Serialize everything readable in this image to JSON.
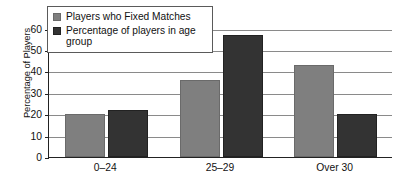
{
  "chart_data": {
    "type": "bar",
    "title": "",
    "xlabel": "",
    "ylabel": "Percentage of Players",
    "categories": [
      "0–24",
      "25–29",
      "Over 30"
    ],
    "series": [
      {
        "name": "Players who Fixed Matches",
        "color": "#7f7f7f",
        "values": [
          20,
          36,
          43
        ]
      },
      {
        "name": "Percentage of players in age group",
        "color": "#333333",
        "values": [
          22,
          57,
          20
        ]
      }
    ],
    "ylim": [
      0,
      65
    ],
    "yticks": [
      0,
      10,
      20,
      30,
      40,
      50,
      60
    ],
    "ytick_labels": [
      "0",
      "10",
      "20",
      "30",
      "40",
      "50",
      "60"
    ],
    "grid": true,
    "legend_position": "top-left"
  },
  "legend": {
    "entries": [
      {
        "label": "Players who Fixed Matches",
        "swatch": "series-a"
      },
      {
        "label": "Percentage of players in age group",
        "swatch": "series-b"
      }
    ]
  }
}
